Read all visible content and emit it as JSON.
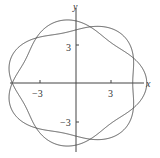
{
  "chart_data": {
    "type": "line",
    "title": "",
    "xlabel": "x",
    "ylabel": "y",
    "x_ticks": [
      {
        "value": -3,
        "label": "−3"
      },
      {
        "value": 3,
        "label": "3"
      }
    ],
    "y_ticks": [
      {
        "value": 3,
        "label": "3"
      },
      {
        "value": -3,
        "label": "−3"
      }
    ],
    "xlim": [
      -6,
      6
    ],
    "ylim": [
      -6,
      6
    ],
    "grid": false,
    "legend": "none",
    "series": [
      {
        "name": "closed parametric curve (interlaced rose-like loop)",
        "description": "Closed curve with 7 interlaced lobes; outer extent about x ±5.7, y ±4.8; inner crossings near x ±4.5, y ±3.3",
        "color": "#555555"
      }
    ]
  },
  "axes": {
    "x_label": "x",
    "y_label": "y",
    "tick_labels": {
      "x_neg": "−3",
      "x_pos": "3",
      "y_pos": "3",
      "y_neg": "−3"
    }
  }
}
